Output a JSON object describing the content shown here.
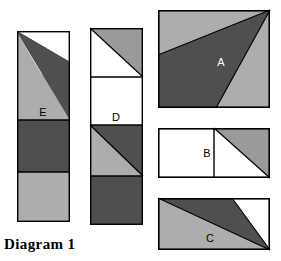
{
  "diagram": {
    "caption": "Diagram 1",
    "width": 281,
    "height": 261,
    "background": "#ffffff",
    "palette": {
      "white": "#ffffff",
      "light_gray": "#adadad",
      "dark_gray": "#4f4f4f",
      "outline": "#000000",
      "label_on_light": "#000000",
      "label_on_dark": "#ffffff"
    },
    "shapes": [
      {
        "id": "E",
        "label": "E",
        "label_color": "#000000",
        "kind": "tall-strip",
        "description": "Tall vertical strip of four stacked bands: top band light gray with white upper-right corner crossed by a dark wedge, second band light gray with the dark wedge tapering to the right edge, third band solid dark gray, bottom band solid light gray.",
        "bounds": {
          "x": 17,
          "y": 31,
          "width": 53,
          "height": 191
        },
        "bands": [
          {
            "name": "band-1",
            "fill": "light_gray",
            "overlay": "white-corner-and-dark-wedge"
          },
          {
            "name": "band-2",
            "fill": "light_gray",
            "overlay": "dark-wedge-taper"
          },
          {
            "name": "band-3",
            "fill": "dark_gray",
            "overlay": "none"
          },
          {
            "name": "band-4",
            "fill": "light_gray",
            "overlay": "none"
          }
        ]
      },
      {
        "id": "D",
        "label": "D",
        "label_color": "#000000",
        "kind": "tall-strip",
        "description": "Tall vertical strip of four stacked squares: white with dark-gray upper-right triangle, plain white, light gray with dark-gray upper-right triangle, solid dark gray.",
        "bounds": {
          "x": 90,
          "y": 28,
          "width": 53,
          "height": 197
        },
        "bands": [
          {
            "name": "band-1",
            "fill": "white",
            "overlay": "gray-upper-right-triangle"
          },
          {
            "name": "band-2",
            "fill": "white",
            "overlay": "none"
          },
          {
            "name": "band-3",
            "fill": "light_gray",
            "overlay": "dark-upper-right-triangle"
          },
          {
            "name": "band-4",
            "fill": "dark_gray",
            "overlay": "none"
          }
        ]
      },
      {
        "id": "A",
        "label": "A",
        "label_color": "#ffffff",
        "kind": "square",
        "description": "Light gray square containing a large dark-gray quadrilateral whose apex is the top-right corner; one edge runs to the left side and another runs down to the bottom edge.",
        "bounds": {
          "x": 158,
          "y": 10,
          "width": 112,
          "height": 98
        }
      },
      {
        "id": "B",
        "label": "B",
        "label_color": "#000000",
        "kind": "double-square",
        "description": "Wide rectangle divided into two squares by a vertical line; left square is white, right square is white with a dark-gray upper-right triangle.",
        "bounds": {
          "x": 158,
          "y": 128,
          "width": 112,
          "height": 50
        }
      },
      {
        "id": "C",
        "label": "C",
        "label_color": "#000000",
        "kind": "rectangle",
        "description": "Wide rectangle split by two lines from the top-left region to the bottom-right corner: light gray lower-left triangle, dark gray sliver, white upper-right triangle.",
        "bounds": {
          "x": 158,
          "y": 198,
          "width": 112,
          "height": 52
        }
      }
    ]
  }
}
